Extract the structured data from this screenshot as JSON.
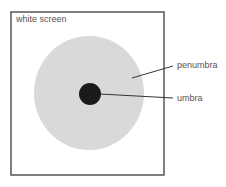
{
  "diagram": {
    "screen_label": "white screen",
    "labels": {
      "penumbra": "penumbra",
      "umbra": "umbra"
    },
    "colors": {
      "frame": "#555555",
      "penumbra": "#d9d9d9",
      "umbra": "#1a1a1a",
      "leader": "#333333",
      "text": "#555555"
    }
  }
}
